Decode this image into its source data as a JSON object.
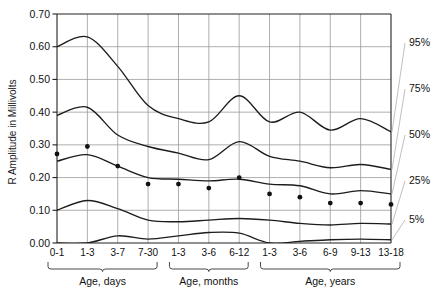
{
  "chart_data": {
    "type": "line",
    "title": "",
    "xlabel": "",
    "ylabel": "R Amplitude in Millivolts",
    "ylim": [
      0.0,
      0.7
    ],
    "ytick_labels": [
      "0.00",
      "0.10",
      "0.20",
      "0.30",
      "0.40",
      "0.50",
      "0.60",
      "0.70"
    ],
    "ytick_values": [
      0.0,
      0.1,
      0.2,
      0.3,
      0.4,
      0.5,
      0.6,
      0.7
    ],
    "grid": true,
    "legend_position": "right",
    "categories": [
      "0-1",
      "1-3",
      "3-7",
      "7-30",
      "1-3",
      "3-6",
      "6-12",
      "1-3",
      "3-6",
      "6-9",
      "9-13",
      "13-18"
    ],
    "group_labels": [
      "Age, days",
      "Age, months",
      "Age, years"
    ],
    "groups": [
      {
        "label": "Age, days",
        "categories": [
          "0-1",
          "1-3",
          "3-7",
          "7-30"
        ]
      },
      {
        "label": "Age, months",
        "categories": [
          "1-3",
          "3-6",
          "6-12"
        ]
      },
      {
        "label": "Age, years",
        "categories": [
          "1-3",
          "3-6",
          "6-9",
          "9-13",
          "13-18"
        ]
      }
    ],
    "series": [
      {
        "name": "95%",
        "label": "95%",
        "values": [
          0.6,
          0.63,
          0.54,
          0.42,
          0.38,
          0.37,
          0.45,
          0.37,
          0.4,
          0.345,
          0.38,
          0.34
        ]
      },
      {
        "name": "75%",
        "label": "75%",
        "values": [
          0.39,
          0.415,
          0.33,
          0.295,
          0.275,
          0.255,
          0.31,
          0.265,
          0.25,
          0.23,
          0.24,
          0.225
        ]
      },
      {
        "name": "50%",
        "label": "50%",
        "values": [
          0.25,
          0.27,
          0.235,
          0.2,
          0.195,
          0.19,
          0.195,
          0.18,
          0.175,
          0.15,
          0.16,
          0.15
        ]
      },
      {
        "name": "25%",
        "label": "25%",
        "values": [
          0.1,
          0.13,
          0.105,
          0.07,
          0.065,
          0.07,
          0.075,
          0.07,
          0.06,
          0.055,
          0.06,
          0.058
        ]
      },
      {
        "name": "5%",
        "label": "5%",
        "values": [
          0.0,
          0.0,
          0.022,
          0.012,
          0.022,
          0.032,
          0.03,
          0.0,
          0.005,
          0.01,
          0.012,
          0.01
        ]
      }
    ],
    "markers": {
      "series": "50%",
      "points": [
        {
          "category": "0-1",
          "value": 0.272
        },
        {
          "category": "1-3",
          "value": 0.295
        },
        {
          "category": "3-7",
          "value": 0.235
        },
        {
          "category": "7-30",
          "value": 0.18
        },
        {
          "category": "1-3",
          "value": 0.18
        },
        {
          "category": "3-6",
          "value": 0.168
        },
        {
          "category": "6-12",
          "value": 0.2
        },
        {
          "category": "1-3",
          "value": 0.15
        },
        {
          "category": "3-6",
          "value": 0.14
        },
        {
          "category": "6-9",
          "value": 0.122
        },
        {
          "category": "9-13",
          "value": 0.122
        },
        {
          "category": "13-18",
          "value": 0.118
        }
      ]
    },
    "percentile_labels": [
      "95%",
      "75%",
      "50%",
      "25%",
      "5%"
    ]
  }
}
